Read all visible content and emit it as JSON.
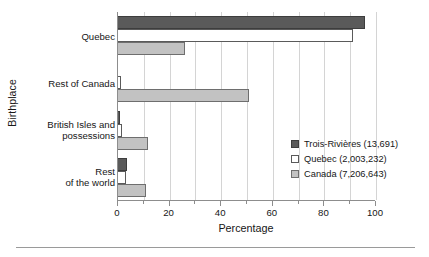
{
  "chart_data": {
    "type": "bar",
    "orientation": "horizontal",
    "title": "",
    "xlabel": "Percentage",
    "ylabel": "Birthplace",
    "categories": [
      "Quebec",
      "Rest of Canada",
      "British Isles and possessions",
      "Rest of the world"
    ],
    "category_lines": [
      [
        "Quebec"
      ],
      [
        "Rest of Canada"
      ],
      [
        "British Isles and",
        "possessions"
      ],
      [
        "Rest",
        "of the world"
      ]
    ],
    "series": [
      {
        "name": "Trois-Rivières (13,691)",
        "color": "#5a5a5a",
        "values": [
          95.8,
          0.2,
          0.6,
          3.4
        ]
      },
      {
        "name": "Quebec (2,003,232)",
        "color": "#ffffff",
        "values": [
          91.0,
          1.1,
          1.4,
          3.0
        ]
      },
      {
        "name": "Canada (7,206,643)",
        "color": "#c2c2c2",
        "values": [
          26.0,
          50.8,
          11.5,
          11.0
        ]
      }
    ],
    "xlim": [
      0,
      100
    ],
    "xticks": [
      0,
      20,
      40,
      60,
      80,
      100
    ],
    "xtick_labels": [
      "0",
      "20",
      "40",
      "60",
      "80",
      "100"
    ],
    "xticks_minor": [
      10,
      30,
      50,
      70,
      90
    ],
    "grid": "vertical",
    "legend_position": "center-right"
  },
  "legend": {
    "entries": [
      {
        "label": "Trois-Rivières (13,691)"
      },
      {
        "label": "Quebec (2,003,232)"
      },
      {
        "label": "Canada (7,206,643)"
      }
    ]
  }
}
